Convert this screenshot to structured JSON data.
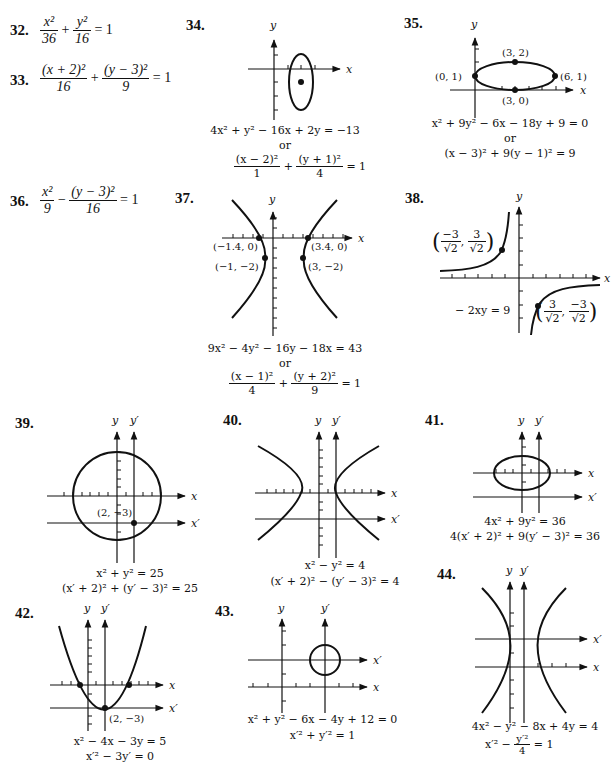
{
  "problems": {
    "p32": {
      "number": "32.",
      "lhs_num1": "x²",
      "lhs_den1": "36",
      "op": "+",
      "lhs_num2": "y²",
      "lhs_den2": "16",
      "rhs": "= 1"
    },
    "p33": {
      "number": "33.",
      "lhs_num1": "(x + 2)²",
      "lhs_den1": "16",
      "op": "+",
      "lhs_num2": "(y − 3)²",
      "lhs_den2": "9",
      "rhs": "= 1"
    },
    "p34": {
      "number": "34.",
      "axis_x": "x",
      "axis_y": "y",
      "equation1": "4x² + y² − 16x + 2y = −13",
      "or": "or",
      "eq2_num1": "(x − 2)²",
      "eq2_den1": "1",
      "eq2_op": "+",
      "eq2_num2": "(y + 1)²",
      "eq2_den2": "4",
      "eq2_rhs": "= 1"
    },
    "p35": {
      "number": "35.",
      "axis_x": "x",
      "axis_y": "y",
      "points": [
        "(3, 2)",
        "(0, 1)",
        "(6, 1)",
        "(3, 0)"
      ],
      "equation1": "x² + 9y² − 6x − 18y + 9 = 0",
      "or": "or",
      "equation2": "(x − 3)² + 9(y − 1)² = 9"
    },
    "p36": {
      "number": "36.",
      "lhs_num1": "x²",
      "lhs_den1": "9",
      "op": "−",
      "lhs_num2": "(y − 3)²",
      "lhs_den2": "16",
      "rhs": "= 1"
    },
    "p37": {
      "number": "37.",
      "axis_x": "x",
      "axis_y": "y",
      "points": [
        "(−1.4, 0)",
        "(3.4, 0)",
        "(−1, −2)",
        "(3, −2)"
      ],
      "equation1": "9x² − 4y² − 16y − 18x = 43",
      "or": "or",
      "eq2_num1": "(x − 1)²",
      "eq2_den1": "4",
      "eq2_op": "+",
      "eq2_num2": "(y + 2)²",
      "eq2_den2": "9",
      "eq2_rhs": "= 1"
    },
    "p38": {
      "number": "38.",
      "axis_x": "x",
      "axis_y": "y",
      "point1_x_num": "−3",
      "point1_x_den": "√2",
      "point1_y_num": "3",
      "point1_y_den": "√2",
      "point2_x_num": "3",
      "point2_x_den": "√2",
      "point2_y_num": "−3",
      "point2_y_den": "√2",
      "equation": "− 2xy = 9"
    },
    "p39": {
      "number": "39.",
      "axis_x": "x",
      "axis_y": "y",
      "axis_xp": "x′",
      "axis_yp": "y′",
      "point": "(2, −3)",
      "equation1": "x² + y² = 25",
      "equation2": "(x′ + 2)² + (y′ − 3)² = 25"
    },
    "p40": {
      "number": "40.",
      "axis_x": "x",
      "axis_y": "y",
      "axis_xp": "x′",
      "axis_yp": "y′",
      "equation1": "x² − y² = 4",
      "equation2": "(x′ + 2)² − (y′ − 3)² = 4"
    },
    "p41": {
      "number": "41.",
      "axis_x": "x",
      "axis_y": "y",
      "axis_xp": "x′",
      "axis_yp": "y′",
      "equation1": "4x² + 9y² = 36",
      "equation2": "4(x′ + 2)² + 9(y′ − 3)² = 36"
    },
    "p42": {
      "number": "42.",
      "axis_x": "x",
      "axis_y": "y",
      "axis_xp": "x′",
      "axis_yp": "y′",
      "point": "(2, −3)",
      "equation1": "x² − 4x − 3y = 5",
      "equation2": "x′² − 3y′ = 0"
    },
    "p43": {
      "number": "43.",
      "axis_x": "x",
      "axis_y": "y",
      "axis_xp": "x′",
      "axis_yp": "y′",
      "equation1": "x² + y² − 6x − 4y + 12 = 0",
      "equation2": "x′² + y′² = 1"
    },
    "p44": {
      "number": "44.",
      "axis_x": "x",
      "axis_y": "y",
      "axis_xp": "x′",
      "axis_yp": "y′",
      "equation1": "4x² − y² − 8x + 4y = 4",
      "eq2_lhs": "x′² −",
      "eq2_num": "y′²",
      "eq2_den": "4",
      "eq2_rhs": "= 1"
    }
  }
}
